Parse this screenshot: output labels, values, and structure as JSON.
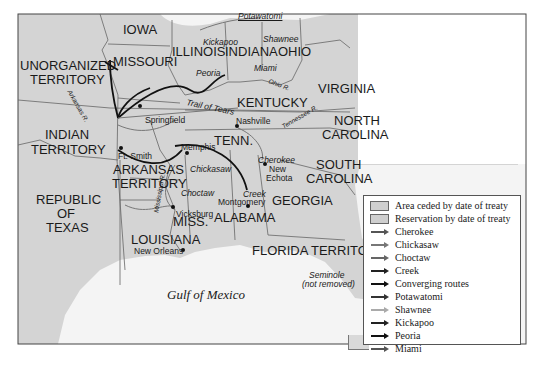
{
  "map": {
    "states": [
      {
        "name": "IOWA",
        "x": 123,
        "y": 28
      },
      {
        "name": "MISSOURI",
        "x": 113,
        "y": 60
      },
      {
        "name": "ILLINOIS",
        "x": 175,
        "y": 49
      },
      {
        "name": "INDIANA",
        "x": 225,
        "y": 49
      },
      {
        "name": "OHIO",
        "x": 278,
        "y": 49
      },
      {
        "name": "VIRGINIA",
        "x": 318,
        "y": 86
      },
      {
        "name": "KENTUCKY",
        "x": 237,
        "y": 99
      },
      {
        "name": "UNORGANIZED",
        "x": 20,
        "y": 62
      },
      {
        "name": "TERRITORY",
        "x": 30,
        "y": 76
      },
      {
        "name": "INDIAN",
        "x": 45,
        "y": 132
      },
      {
        "name": "TERRITORY",
        "x": 31,
        "y": 147
      },
      {
        "name": "TENN.",
        "x": 255,
        "y": 137
      },
      {
        "name": "NORTH",
        "x": 334,
        "y": 117
      },
      {
        "name": "CAROLINA",
        "x": 325,
        "y": 131
      },
      {
        "name": "SOUTH",
        "x": 316,
        "y": 161
      },
      {
        "name": "CAROLINA",
        "x": 308,
        "y": 175
      },
      {
        "name": "ARKANSAS",
        "x": 114,
        "y": 168
      },
      {
        "name": "TERRITORY",
        "x": 113,
        "y": 182
      },
      {
        "name": "REPUBLIC",
        "x": 36,
        "y": 193
      },
      {
        "name": "OF",
        "x": 57,
        "y": 207
      },
      {
        "name": "TEXAS",
        "x": 46,
        "y": 221
      },
      {
        "name": "GEORGIA",
        "x": 273,
        "y": 195
      },
      {
        "name": "ALABAMA",
        "x": 213,
        "y": 215
      },
      {
        "name": "MISS.",
        "x": 173,
        "y": 218
      },
      {
        "name": "LOUISIANA",
        "x": 131,
        "y": 237
      },
      {
        "name": "FLORIDA TERRITORY",
        "x": 252,
        "y": 247
      }
    ],
    "cities": [
      {
        "name": "Springfield",
        "x": 145,
        "y": 120,
        "dx": 140,
        "dy": 107
      },
      {
        "name": "Nashville",
        "x": 237,
        "y": 128,
        "dx": 237,
        "dy": 125
      },
      {
        "name": "Ft. Smith",
        "x": 119,
        "y": 153,
        "dx": 122,
        "dy": 148
      },
      {
        "name": "Memphis",
        "x": 181,
        "y": 148,
        "dx": 187,
        "dy": 153
      },
      {
        "name": "New",
        "x": 270,
        "y": 164,
        "dx": 265,
        "dy": 164
      },
      {
        "name": "Echota",
        "x": 267,
        "y": 174,
        "dx": 265,
        "dy": 164
      },
      {
        "name": "Montgomery",
        "x": 218,
        "y": 197,
        "dx": 248,
        "dy": 206
      },
      {
        "name": "Vicksburg",
        "x": 176,
        "y": 211,
        "dx": 173,
        "dy": 207
      },
      {
        "name": "New Orleans",
        "x": 134,
        "y": 249,
        "dx": 183,
        "dy": 250
      }
    ],
    "tribes": [
      {
        "name": "Potawatomi",
        "x": 238,
        "y": 16
      },
      {
        "name": "Kickapoo",
        "x": 202,
        "y": 40
      },
      {
        "name": "Shawnee",
        "x": 263,
        "y": 38
      },
      {
        "name": "Peoria",
        "x": 195,
        "y": 69
      },
      {
        "name": "Miami",
        "x": 254,
        "y": 66
      },
      {
        "name": "Trail of Tears",
        "x": 186,
        "y": 108
      },
      {
        "name": "Chickasaw",
        "x": 190,
        "y": 168
      },
      {
        "name": "Choctaw",
        "x": 181,
        "y": 191
      },
      {
        "name": "Cherokee",
        "x": 258,
        "y": 157
      },
      {
        "name": "Creek",
        "x": 241,
        "y": 189
      },
      {
        "name": "Seminole",
        "x": 309,
        "y": 273
      },
      {
        "name": "(not removed)",
        "x": 302,
        "y": 282
      }
    ],
    "rivers": [
      {
        "name": "Arkansas R.",
        "x": 62,
        "y": 110,
        "rotate": 60
      },
      {
        "name": "Ohio R.",
        "x": 269,
        "y": 85,
        "rotate": 20
      },
      {
        "name": "Tennessee R.",
        "x": 285,
        "y": 115,
        "rotate": -30
      },
      {
        "name": "Mississippi R.",
        "x": 150,
        "y": 196,
        "rotate": -80
      }
    ],
    "water_label": {
      "name": "Gulf of Mexico",
      "x": 167,
      "y": 292
    }
  },
  "legend": {
    "items": [
      {
        "label": "Area ceded by date of treaty",
        "type": "swatch",
        "color": "#cfcfcf"
      },
      {
        "label": "Reservation by date of treaty",
        "type": "swatch",
        "color": "#cfcfcf"
      },
      {
        "label": "Cherokee",
        "type": "arrow",
        "color": "#555555"
      },
      {
        "label": "Chickasaw",
        "type": "arrow",
        "color": "#777777"
      },
      {
        "label": "Choctaw",
        "type": "arrow",
        "color": "#666666"
      },
      {
        "label": "Creek",
        "type": "arrow",
        "color": "#222222"
      },
      {
        "label": "Converging routes",
        "type": "arrow",
        "color": "#111111"
      },
      {
        "label": "Potawatomi",
        "type": "arrow",
        "color": "#333333"
      },
      {
        "label": "Shawnee",
        "type": "arrow",
        "color": "#aaaaaa"
      },
      {
        "label": "Kickapoo",
        "type": "arrow",
        "color": "#222222"
      },
      {
        "label": "Peoria",
        "type": "arrow",
        "color": "#111111"
      },
      {
        "label": "Miami",
        "type": "arrow",
        "color": "#555555"
      }
    ]
  },
  "colors": {
    "land": "#d6d6d6",
    "water": "#f2f2f2",
    "border": "#555555",
    "route_dark": "#111111"
  }
}
